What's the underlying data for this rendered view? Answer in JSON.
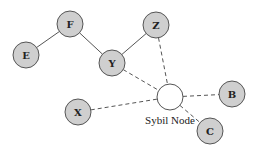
{
  "diagram": {
    "title": "",
    "colors": {
      "node_fill": "#cfcfcf",
      "node_stroke": "#555555",
      "sybil_fill": "#ffffff",
      "edge": "#555555"
    },
    "nodes": [
      {
        "id": "F",
        "label": "F",
        "x": 70,
        "y": 24,
        "r": 13,
        "type": "honest"
      },
      {
        "id": "E",
        "label": "E",
        "x": 26,
        "y": 55,
        "r": 13,
        "type": "honest"
      },
      {
        "id": "Y",
        "label": "Y",
        "x": 112,
        "y": 63,
        "r": 13,
        "type": "honest"
      },
      {
        "id": "Z",
        "label": "Z",
        "x": 156,
        "y": 25,
        "r": 13,
        "type": "honest"
      },
      {
        "id": "X",
        "label": "X",
        "x": 78,
        "y": 112,
        "r": 13,
        "type": "honest"
      },
      {
        "id": "B",
        "label": "B",
        "x": 232,
        "y": 94,
        "r": 13,
        "type": "honest"
      },
      {
        "id": "C",
        "label": "C",
        "x": 210,
        "y": 131,
        "r": 13,
        "type": "honest"
      },
      {
        "id": "S",
        "label": "",
        "x": 170,
        "y": 97,
        "r": 13,
        "type": "sybil"
      }
    ],
    "edges": [
      {
        "from": "E",
        "to": "F",
        "style": "solid"
      },
      {
        "from": "F",
        "to": "Y",
        "style": "solid"
      },
      {
        "from": "Y",
        "to": "Z",
        "style": "solid"
      },
      {
        "from": "Y",
        "to": "S",
        "style": "dashed"
      },
      {
        "from": "Z",
        "to": "S",
        "style": "dashed"
      },
      {
        "from": "X",
        "to": "S",
        "style": "dashed"
      },
      {
        "from": "S",
        "to": "B",
        "style": "dashed"
      },
      {
        "from": "S",
        "to": "C",
        "style": "dashed"
      }
    ],
    "sybil_caption": "Sybil Node"
  }
}
